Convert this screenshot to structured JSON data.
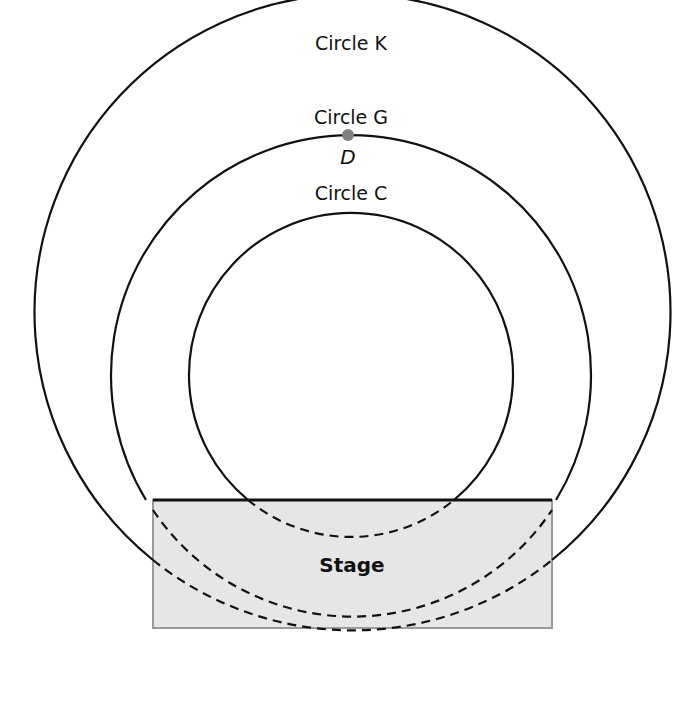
{
  "diagram": {
    "circles": [
      {
        "id": "K",
        "label": "Circle K",
        "cx": 351,
        "cy": 375,
        "r": 318
      },
      {
        "id": "G",
        "label": "Circle G",
        "cx": 351,
        "cy": 375,
        "r": 240
      },
      {
        "id": "C",
        "label": "Circle C",
        "cx": 351,
        "cy": 375,
        "r": 162
      }
    ],
    "point": {
      "label": "D",
      "on_circle": "G",
      "color": "#808080"
    },
    "stage": {
      "label": "Stage",
      "fill": "#e6e6e6",
      "border": "#999999",
      "x": 153,
      "y": 500,
      "width": 399,
      "height": 128
    },
    "colors": {
      "line": "#111111",
      "background": "#ffffff"
    }
  }
}
